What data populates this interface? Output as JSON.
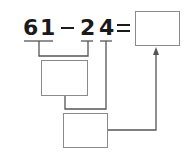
{
  "equation": {
    "tens_a": "6",
    "ones_a": "1",
    "operator": "−",
    "tens_b": "2",
    "ones_b": "4",
    "equals": "="
  },
  "boxes": {
    "answer": "",
    "step1": "",
    "step2": ""
  },
  "colors": {
    "text": "#1a1a1a",
    "box_border": "#8a8a8a",
    "line": "#555555"
  }
}
